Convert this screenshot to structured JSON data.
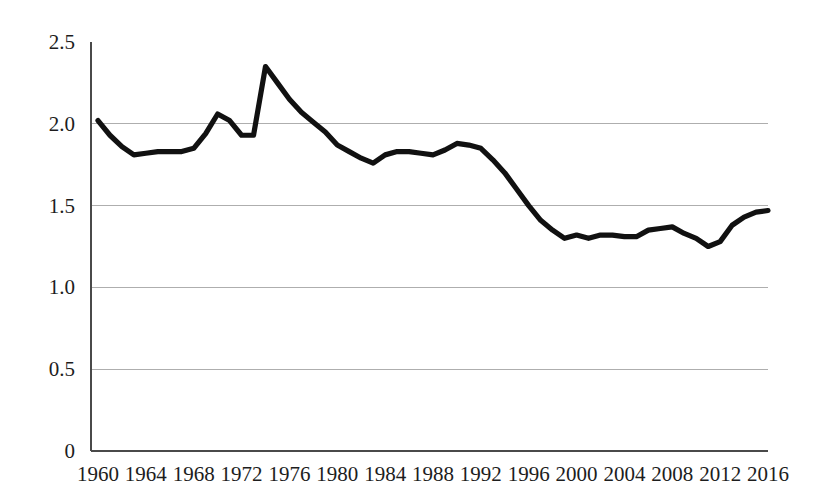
{
  "chart_data": {
    "type": "line",
    "title": "",
    "subtitle": "",
    "xlabel": "",
    "ylabel": "",
    "grid": true,
    "legend": false,
    "legend_position": "none",
    "series_color": "#111111",
    "grid_color": "#aeaeae",
    "axis_color": "#4a4a4a",
    "xlim": [
      1960,
      2016
    ],
    "ylim": [
      0,
      2.5
    ],
    "y_ticks": [
      0,
      0.5,
      1.0,
      1.5,
      2.0,
      2.5
    ],
    "y_tick_labels": [
      "0",
      "0.5",
      "1.0",
      "1.5",
      "2.0",
      "2.5"
    ],
    "y_gridline_values": [
      0.5,
      1.0,
      1.5,
      2.0
    ],
    "x_ticks": [
      1960,
      1964,
      1968,
      1972,
      1976,
      1980,
      1984,
      1988,
      1992,
      1996,
      2000,
      2004,
      2008,
      2012,
      2016
    ],
    "x_tick_labels": [
      "1960",
      "1964",
      "1968",
      "1972",
      "1976",
      "1980",
      "1984",
      "1988",
      "1992",
      "1996",
      "2000",
      "2004",
      "2008",
      "2012",
      "2016"
    ],
    "x": [
      1960,
      1961,
      1962,
      1963,
      1964,
      1965,
      1966,
      1967,
      1968,
      1969,
      1970,
      1971,
      1972,
      1973,
      1974,
      1975,
      1976,
      1977,
      1978,
      1979,
      1980,
      1981,
      1982,
      1983,
      1984,
      1985,
      1986,
      1987,
      1988,
      1989,
      1990,
      1991,
      1992,
      1993,
      1994,
      1995,
      1996,
      1997,
      1998,
      1999,
      2000,
      2001,
      2002,
      2003,
      2004,
      2005,
      2006,
      2007,
      2008,
      2009,
      2010,
      2011,
      2012,
      2013,
      2014,
      2015,
      2016
    ],
    "values": [
      2.02,
      1.93,
      1.86,
      1.81,
      1.82,
      1.83,
      1.83,
      1.83,
      1.85,
      1.94,
      2.06,
      2.02,
      1.93,
      1.93,
      2.35,
      2.25,
      2.15,
      2.07,
      2.01,
      1.95,
      1.87,
      1.83,
      1.79,
      1.76,
      1.81,
      1.83,
      1.83,
      1.82,
      1.81,
      1.84,
      1.88,
      1.87,
      1.85,
      1.78,
      1.7,
      1.6,
      1.5,
      1.41,
      1.35,
      1.3,
      1.32,
      1.3,
      1.32,
      1.32,
      1.31,
      1.31,
      1.35,
      1.36,
      1.37,
      1.33,
      1.3,
      1.25,
      1.28,
      1.38,
      1.43,
      1.46,
      1.47
    ]
  },
  "axis": {
    "y_labels": [
      "2.5",
      "2.0",
      "1.5",
      "1.0",
      "0.5",
      "0"
    ],
    "x_labels": [
      "1960",
      "1964",
      "1968",
      "1972",
      "1976",
      "1980",
      "1984",
      "1988",
      "1992",
      "1996",
      "2000",
      "2004",
      "2008",
      "2012",
      "2016"
    ]
  }
}
